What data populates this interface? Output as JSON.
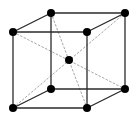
{
  "diagram": {
    "type": "body-centered-cubic-unit-cell",
    "colors": {
      "background": "#ffffff",
      "edge": "#2a2a2a",
      "diagonal": "#9a9a9a",
      "atom": "#000000"
    },
    "atoms": [
      {
        "id": "front-top-left",
        "x": 13,
        "y": 32
      },
      {
        "id": "front-top-right",
        "x": 87,
        "y": 32
      },
      {
        "id": "front-bottom-left",
        "x": 13,
        "y": 108
      },
      {
        "id": "front-bottom-right",
        "x": 87,
        "y": 108
      },
      {
        "id": "back-top-left",
        "x": 51,
        "y": 13
      },
      {
        "id": "back-top-right",
        "x": 125,
        "y": 13
      },
      {
        "id": "back-bottom-left",
        "x": 51,
        "y": 89
      },
      {
        "id": "back-bottom-right",
        "x": 125,
        "y": 89
      },
      {
        "id": "body-center",
        "x": 69,
        "y": 60
      }
    ],
    "edges": [
      [
        "front-top-left",
        "front-top-right"
      ],
      [
        "front-top-right",
        "front-bottom-right"
      ],
      [
        "front-bottom-right",
        "front-bottom-left"
      ],
      [
        "front-bottom-left",
        "front-top-left"
      ],
      [
        "back-top-left",
        "back-top-right"
      ],
      [
        "back-top-right",
        "back-bottom-right"
      ],
      [
        "back-bottom-right",
        "back-bottom-left"
      ],
      [
        "back-bottom-left",
        "back-top-left"
      ],
      [
        "front-top-left",
        "back-top-left"
      ],
      [
        "front-top-right",
        "back-top-right"
      ],
      [
        "front-bottom-left",
        "back-bottom-left"
      ],
      [
        "front-bottom-right",
        "back-bottom-right"
      ]
    ],
    "diagonals": [
      [
        "front-top-left",
        "back-bottom-right"
      ],
      [
        "back-top-left",
        "front-bottom-right"
      ],
      [
        "front-bottom-left",
        "back-top-right"
      ]
    ]
  }
}
